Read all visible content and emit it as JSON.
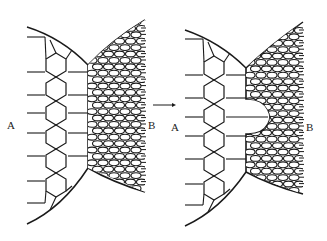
{
  "figure": {
    "panels": [
      {
        "id": "left",
        "label_a": "A",
        "label_b": "B",
        "state": "initial straight boundary"
      },
      {
        "id": "right",
        "label_a": "A",
        "label_b": "B",
        "state": "boundary with bulge of large grain into fine grains"
      }
    ],
    "arrow": "→",
    "colors": {
      "line": "#1a1a1a",
      "background": "#ffffff"
    }
  }
}
